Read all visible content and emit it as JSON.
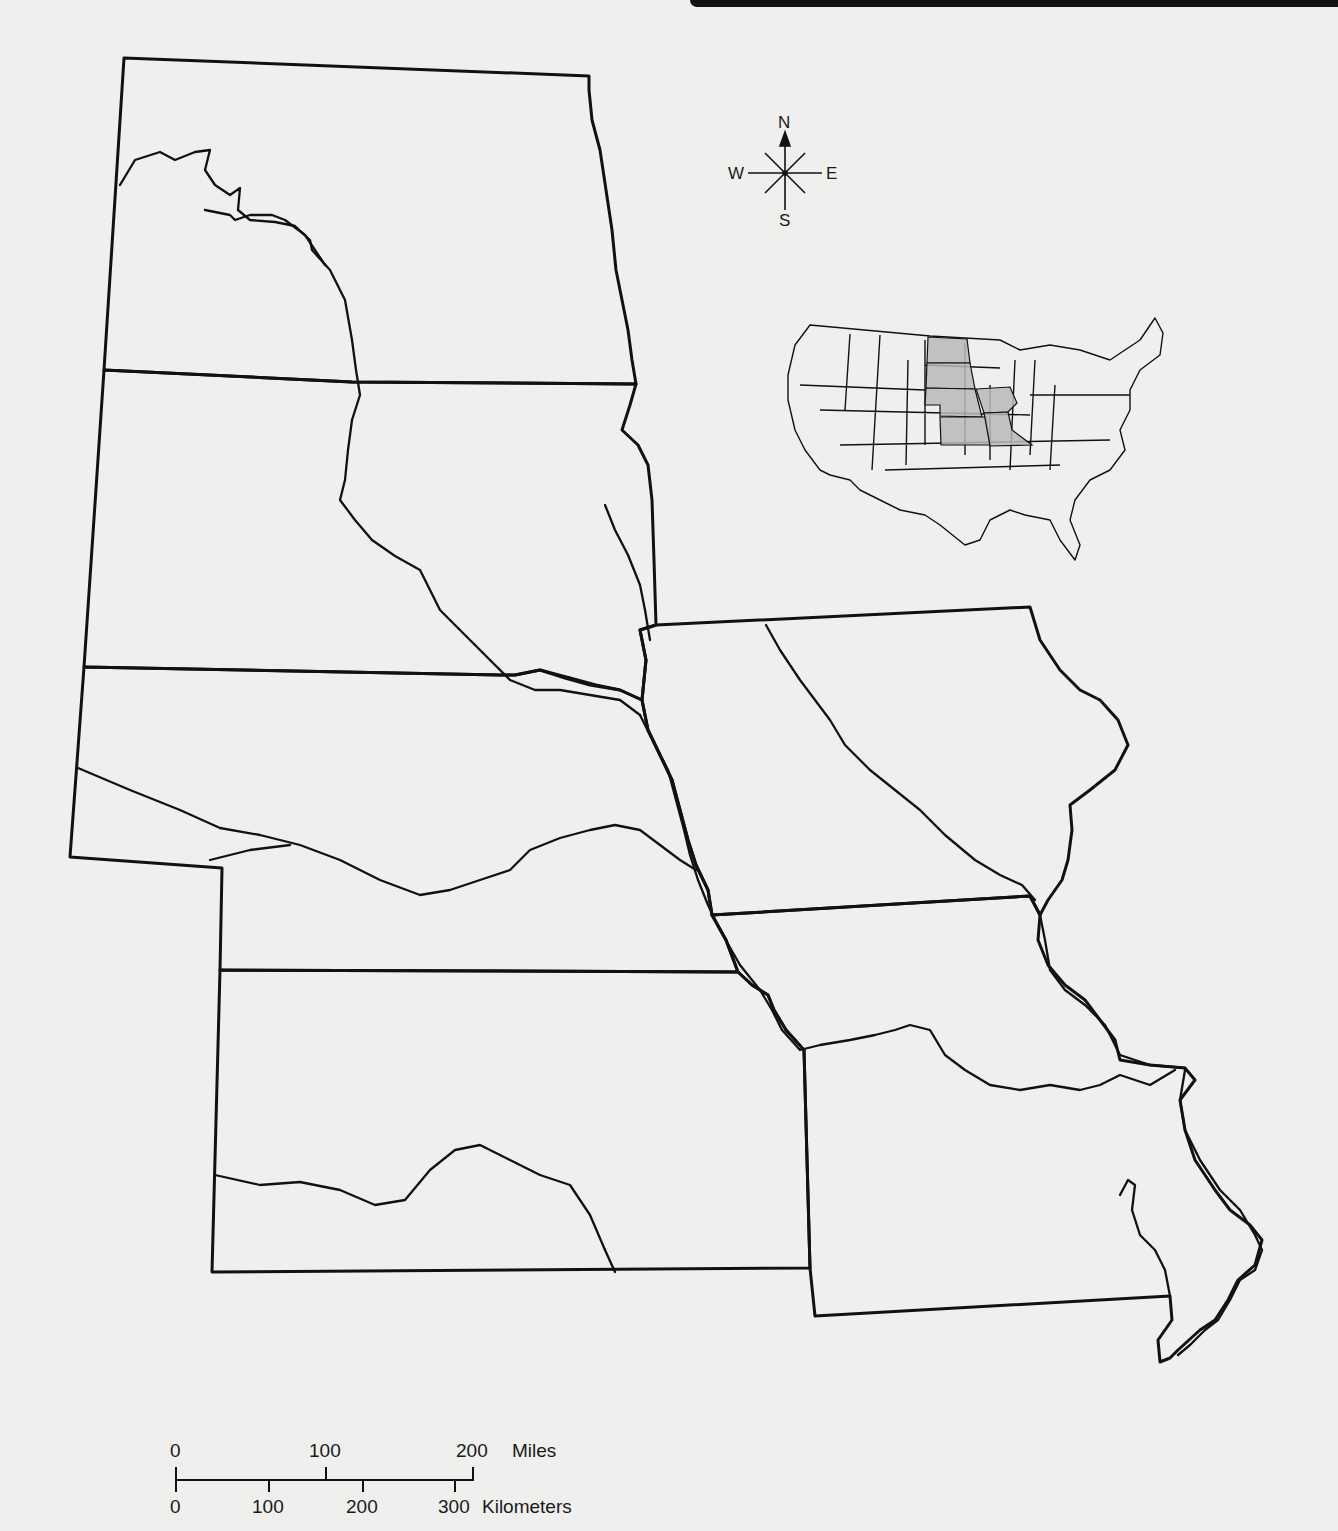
{
  "map": {
    "title": "",
    "region_states_highlighted": [
      "North Dakota",
      "South Dakota",
      "Nebraska",
      "Kansas",
      "Iowa",
      "Missouri"
    ],
    "colors": {
      "background": "#efefed",
      "line": "#111111",
      "highlight_fill": "#b8b8b8"
    }
  },
  "compass": {
    "north": "N",
    "south": "S",
    "east": "E",
    "west": "W"
  },
  "scale_bar": {
    "miles_ticks": [
      "0",
      "100",
      "200"
    ],
    "miles_unit": "Miles",
    "km_ticks": [
      "0",
      "100",
      "200",
      "300"
    ],
    "km_unit": "Kilometers"
  },
  "locator_map": {
    "description": "Outline of contiguous United States with six Great Plains states shaded"
  }
}
